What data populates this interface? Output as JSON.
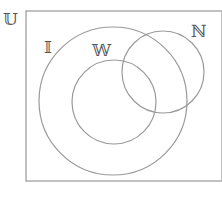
{
  "diagram": {
    "type": "venn",
    "stroke_color": "#9a9a9a",
    "universe": {
      "label": "𝕌",
      "rect": {
        "x": 26,
        "y": 11,
        "width": 196,
        "height": 170
      }
    },
    "sets": [
      {
        "id": "I",
        "label": "𝕀",
        "cx": 113,
        "cy": 101,
        "r": 74
      },
      {
        "id": "W",
        "label": "𝕎",
        "cx": 114,
        "cy": 102,
        "r": 42
      },
      {
        "id": "N",
        "label": "ℕ",
        "cx": 163,
        "cy": 72,
        "r": 41
      }
    ],
    "relations": [
      "W is a subset of I",
      "N partially overlaps I",
      "N partially overlaps W",
      "All sets within universe U"
    ]
  }
}
